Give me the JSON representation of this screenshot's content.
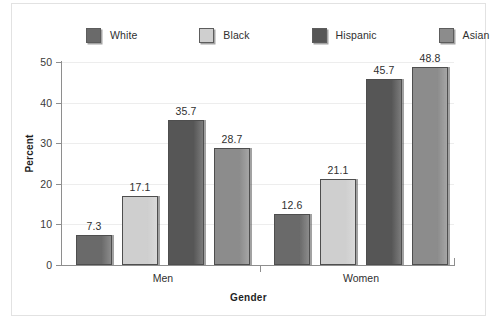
{
  "chart_data": {
    "type": "bar",
    "title": "",
    "xlabel": "Gender",
    "ylabel": "Percent",
    "categories": [
      "Men",
      "Women"
    ],
    "series": [
      {
        "name": "White",
        "values": [
          7.3,
          12.6
        ],
        "color": "#6a6a6a"
      },
      {
        "name": "Black",
        "values": [
          17.1,
          21.1
        ],
        "color": "#cfcfcf"
      },
      {
        "name": "Hispanic",
        "values": [
          35.7,
          45.7
        ],
        "color": "#565656"
      },
      {
        "name": "Asian",
        "values": [
          28.7,
          48.8
        ],
        "color": "#8c8c8c"
      }
    ],
    "ylim": [
      0,
      50
    ],
    "yticks": [
      0,
      10,
      20,
      30,
      40,
      50
    ],
    "ytick_labels": [
      "0",
      "10",
      "20",
      "30",
      "40",
      "50"
    ],
    "grid": true,
    "grid_color": "#ededed",
    "legend_position": "top",
    "value_labels": [
      "7.3",
      "17.1",
      "35.7",
      "28.7",
      "12.6",
      "21.1",
      "45.7",
      "48.8"
    ],
    "axis_color": "#8e8e8e",
    "background": "#ffffff"
  },
  "legend": {
    "items": [
      {
        "label": "White"
      },
      {
        "label": "Black"
      },
      {
        "label": "Hispanic"
      },
      {
        "label": "Asian"
      }
    ]
  }
}
